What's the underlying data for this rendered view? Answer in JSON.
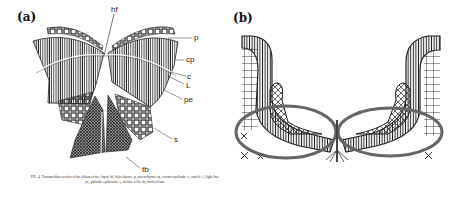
{
  "panels": [
    {
      "id": "a",
      "label": "(a)",
      "annotations": {
        "hf": "hf",
        "p": "p",
        "cp": "cp",
        "c": "c",
        "L": "L",
        "pe": "pe",
        "s": "s",
        "tb": "tb"
      },
      "caption": "FIG. 4. Transmedian section of the hilum of tree lupin. hf, hilar fissure; p, parenchyma; cp, counter-palisade; c, cuticle; l, light line; pe, palisade epidermis; s, stellate cells; tb, tracheid bar."
    },
    {
      "id": "b",
      "label": "(b)"
    }
  ],
  "colors": {
    "ink": "#1a1a1a",
    "outline_gray": "#666666",
    "background": "#ffffff"
  }
}
